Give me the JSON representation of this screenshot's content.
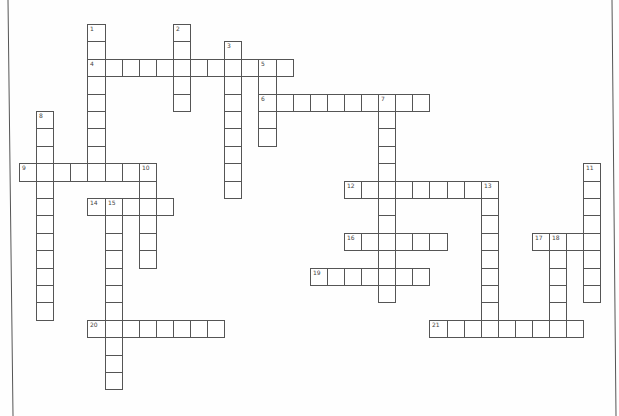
{
  "puzzle": {
    "type": "crossword",
    "grid": {
      "origin_x": 19,
      "origin_y": 24,
      "cell_w": 17.1,
      "cell_h": 17.4
    },
    "colors": {
      "line": "#555555",
      "border": "#555555",
      "background": "#fefefe",
      "number": "#444444"
    },
    "entries": [
      {
        "number": 1,
        "direction": "down",
        "row": 0,
        "col": 4,
        "length": 9
      },
      {
        "number": 2,
        "direction": "down",
        "row": 0,
        "col": 9,
        "length": 5
      },
      {
        "number": 3,
        "direction": "down",
        "row": 1,
        "col": 12,
        "length": 9
      },
      {
        "number": 4,
        "direction": "across",
        "row": 2,
        "col": 4,
        "length": 12
      },
      {
        "number": 5,
        "direction": "down",
        "row": 2,
        "col": 14,
        "length": 5
      },
      {
        "number": 6,
        "direction": "across",
        "row": 4,
        "col": 14,
        "length": 10
      },
      {
        "number": 7,
        "direction": "down",
        "row": 4,
        "col": 21,
        "length": 12
      },
      {
        "number": 8,
        "direction": "down",
        "row": 5,
        "col": 1,
        "length": 12
      },
      {
        "number": 9,
        "direction": "across",
        "row": 8,
        "col": 0,
        "length": 8
      },
      {
        "number": 10,
        "direction": "down",
        "row": 8,
        "col": 7,
        "length": 6
      },
      {
        "number": 11,
        "direction": "down",
        "row": 8,
        "col": 33,
        "length": 8
      },
      {
        "number": 12,
        "direction": "across",
        "row": 9,
        "col": 19,
        "length": 9
      },
      {
        "number": 13,
        "direction": "down",
        "row": 9,
        "col": 27,
        "length": 9
      },
      {
        "number": 14,
        "direction": "across",
        "row": 10,
        "col": 4,
        "length": 5
      },
      {
        "number": 15,
        "direction": "down",
        "row": 10,
        "col": 5,
        "length": 11
      },
      {
        "number": 16,
        "direction": "across",
        "row": 12,
        "col": 19,
        "length": 6
      },
      {
        "number": 17,
        "direction": "across",
        "row": 12,
        "col": 30,
        "length": 4
      },
      {
        "number": 18,
        "direction": "down",
        "row": 12,
        "col": 31,
        "length": 6
      },
      {
        "number": 19,
        "direction": "across",
        "row": 14,
        "col": 17,
        "length": 7
      },
      {
        "number": 20,
        "direction": "across",
        "row": 17,
        "col": 4,
        "length": 8
      },
      {
        "number": 21,
        "direction": "across",
        "row": 17,
        "col": 24,
        "length": 9
      }
    ]
  }
}
